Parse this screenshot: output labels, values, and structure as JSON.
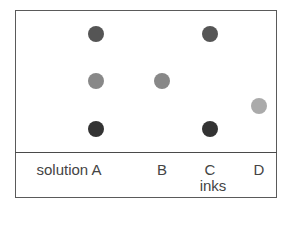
{
  "diagram": {
    "type": "paper-chromatography",
    "labels": {
      "solution": "solution A",
      "b": "B",
      "c": "C",
      "d": "D",
      "axis": "inks"
    },
    "columns": [
      {
        "id": "A",
        "label": "solution A",
        "spots": [
          {
            "row": "top",
            "color": "#555555"
          },
          {
            "row": "middle",
            "color": "#888888"
          },
          {
            "row": "bottom",
            "color": "#333333"
          }
        ]
      },
      {
        "id": "B",
        "label": "B",
        "spots": [
          {
            "row": "middle",
            "color": "#888888"
          }
        ]
      },
      {
        "id": "C",
        "label": "C",
        "spots": [
          {
            "row": "top",
            "color": "#555555"
          },
          {
            "row": "bottom",
            "color": "#333333"
          }
        ]
      },
      {
        "id": "D",
        "label": "D",
        "spots": [
          {
            "row": "lower-middle",
            "color": "#aaaaaa"
          }
        ]
      }
    ]
  }
}
